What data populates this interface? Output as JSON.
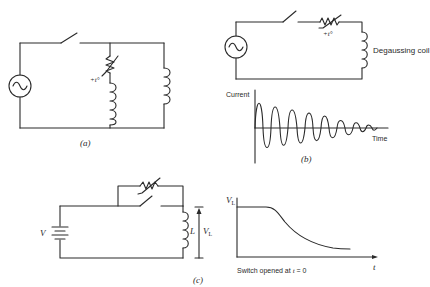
{
  "figure": {
    "panel_a": {
      "label": "(a)",
      "thermistor_label": "+t°",
      "components": [
        "ac-source",
        "switch",
        "ptc-thermistor",
        "inductor",
        "inductor"
      ]
    },
    "panel_b": {
      "label": "(b)",
      "thermistor_label": "+t°",
      "coil_label": "Degaussing coil",
      "graph": {
        "ylabel": "Current",
        "xlabel": "Time"
      }
    },
    "panel_c": {
      "label": "(c)",
      "battery_label": "V",
      "inductor_label": "L",
      "voltage_label": "V",
      "voltage_subscript": "L",
      "graph": {
        "ylabel": "V",
        "ylabel_subscript": "L",
        "xlabel": "t",
        "caption_prefix": "Switch opened at ",
        "caption_var": "t",
        "caption_suffix": " = 0"
      }
    }
  },
  "colors": {
    "ink": "#2a2a2a",
    "background": "#ffffff"
  }
}
